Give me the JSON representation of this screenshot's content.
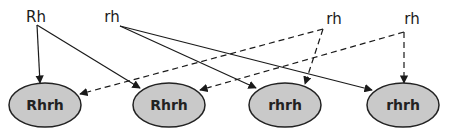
{
  "diagram": {
    "title": "",
    "colors": {
      "node_fill": "#c9c9c9",
      "line": "#1a1a1a",
      "background": "#ffffff"
    },
    "parents": [
      {
        "id": "p1",
        "label": "Rh"
      },
      {
        "id": "p2",
        "label": "rh"
      },
      {
        "id": "p3",
        "label": "rh"
      },
      {
        "id": "p4",
        "label": "rh"
      }
    ],
    "children": [
      {
        "id": "c1",
        "label": "Rhrh"
      },
      {
        "id": "c2",
        "label": "Rhrh"
      },
      {
        "id": "c3",
        "label": "rhrh"
      },
      {
        "id": "c4",
        "label": "rhrh"
      }
    ],
    "edges": [
      {
        "from": "p1",
        "to": "c1",
        "style": "solid"
      },
      {
        "from": "p1",
        "to": "c2",
        "style": "solid"
      },
      {
        "from": "p2",
        "to": "c3",
        "style": "solid"
      },
      {
        "from": "p2",
        "to": "c4",
        "style": "solid"
      },
      {
        "from": "p3",
        "to": "c1",
        "style": "dashed"
      },
      {
        "from": "p3",
        "to": "c3",
        "style": "dashed"
      },
      {
        "from": "p4",
        "to": "c2",
        "style": "dashed"
      },
      {
        "from": "p4",
        "to": "c4",
        "style": "dashed"
      }
    ]
  }
}
